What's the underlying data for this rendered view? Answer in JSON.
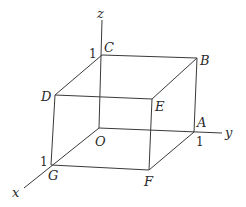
{
  "diagram": {
    "type": "unit-cube-coordinate-system",
    "axes": {
      "x": {
        "label": "x",
        "tick": "1"
      },
      "y": {
        "label": "y",
        "tick": "1"
      },
      "z": {
        "label": "z",
        "tick": "1"
      }
    },
    "vertices": {
      "O": "O",
      "A": "A",
      "B": "B",
      "C": "C",
      "D": "D",
      "E": "E",
      "F": "F",
      "G": "G"
    },
    "colors": {
      "line": "#3a3a3a",
      "text": "#2a2a2a",
      "background": "#ffffff"
    }
  }
}
